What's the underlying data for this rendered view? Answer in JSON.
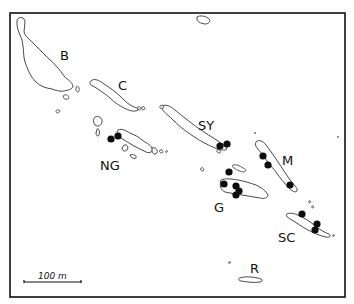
{
  "map": {
    "region": "Solomon Islands",
    "labels": [
      {
        "id": "B",
        "text": "B",
        "x": 60,
        "y": 60
      },
      {
        "id": "C",
        "text": "C",
        "x": 118,
        "y": 90
      },
      {
        "id": "SY",
        "text": "SY",
        "x": 198,
        "y": 130
      },
      {
        "id": "NG",
        "text": "NG",
        "x": 100,
        "y": 170
      },
      {
        "id": "M",
        "text": "M",
        "x": 282,
        "y": 165
      },
      {
        "id": "G",
        "text": "G",
        "x": 214,
        "y": 212
      },
      {
        "id": "SC",
        "text": "SC",
        "x": 278,
        "y": 242
      },
      {
        "id": "R",
        "text": "R",
        "x": 250,
        "y": 273
      }
    ],
    "scale_bar": {
      "label": "100 m",
      "x1": 24,
      "x2": 81,
      "y": 282
    },
    "ink_color": "#111111",
    "background": "#ffffff"
  }
}
